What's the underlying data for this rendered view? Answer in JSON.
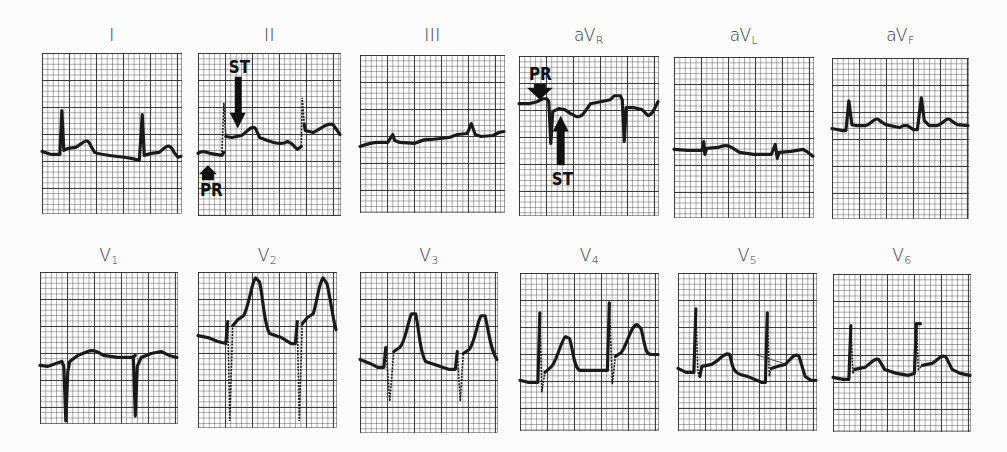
{
  "figure": {
    "leads": [
      {
        "id": "I",
        "base": "I",
        "sub": ""
      },
      {
        "id": "II",
        "base": "II",
        "sub": ""
      },
      {
        "id": "III",
        "base": "III",
        "sub": ""
      },
      {
        "id": "aVR",
        "base": "aV",
        "sub": "R"
      },
      {
        "id": "aVL",
        "base": "aV",
        "sub": "L"
      },
      {
        "id": "aVF",
        "base": "aV",
        "sub": "F"
      },
      {
        "id": "V1",
        "base": "V",
        "sub": "1"
      },
      {
        "id": "V2",
        "base": "V",
        "sub": "2"
      },
      {
        "id": "V3",
        "base": "V",
        "sub": "3"
      },
      {
        "id": "V4",
        "base": "V",
        "sub": "4"
      },
      {
        "id": "V5",
        "base": "V",
        "sub": "5"
      },
      {
        "id": "V6",
        "base": "V",
        "sub": "6"
      }
    ],
    "annotations": {
      "lead_II": {
        "st_label": "ST",
        "pr_label": "PR",
        "st_arrow": "down",
        "pr_arrow": "up"
      },
      "lead_aVR": {
        "pr_label": "PR",
        "st_label": "ST",
        "pr_arrow": "down",
        "st_arrow": "up"
      }
    },
    "colors": {
      "trace": "#1a1a1a",
      "grid_major": "#282828",
      "grid_minor": "#8a8a8a",
      "paper": "#fdfdfd"
    }
  }
}
